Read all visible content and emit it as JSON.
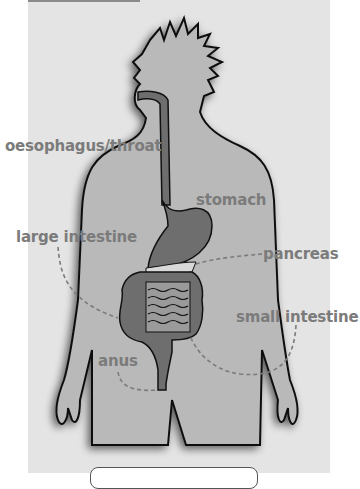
{
  "diagram": {
    "type": "human digestive system",
    "labels": [
      {
        "id": "oesophagus",
        "text": "oesophagus/throat"
      },
      {
        "id": "stomach",
        "text": "stomach"
      },
      {
        "id": "large_intestine",
        "text": "large intestine"
      },
      {
        "id": "pancreas",
        "text": "pancreas"
      },
      {
        "id": "small_intestine",
        "text": "small intestine"
      },
      {
        "id": "anus",
        "text": "anus"
      }
    ],
    "colors": {
      "background_panel": "#e4e4e4",
      "body_fill": "#b9b9b9",
      "organ_fill": "#6e6e6e",
      "label_text": "#7b7b7b",
      "outline": "#111111"
    },
    "answer_box": {
      "text": ""
    }
  }
}
